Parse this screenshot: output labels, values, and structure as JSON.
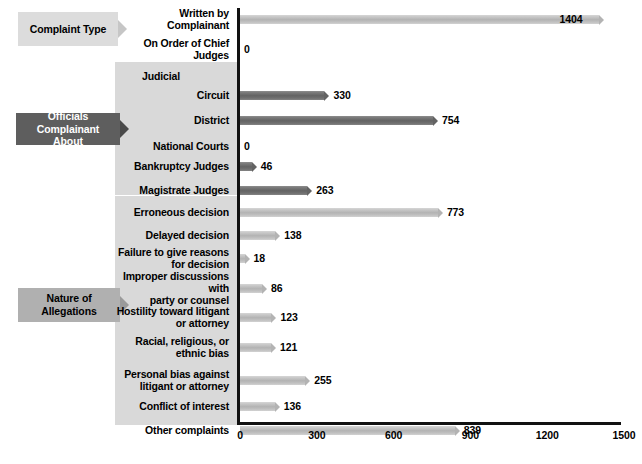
{
  "chart_data": {
    "type": "bar",
    "orientation": "horizontal",
    "title": "",
    "xlabel": "",
    "ylabel": "",
    "xlim": [
      0,
      1500
    ],
    "xticks": [
      "0",
      "300",
      "600",
      "900",
      "1200",
      "1500"
    ],
    "grid": false,
    "legend": null,
    "groups": [
      {
        "label": "Complaint Type",
        "style": "light",
        "categories": [
          {
            "label": "Written by Complainant",
            "value": 1404,
            "shade": "light",
            "label_inside": true
          },
          {
            "label": "On Order of Chief Judges",
            "value": 0,
            "shade": "light"
          }
        ]
      },
      {
        "label": "Officials Complainant About",
        "label_lines": [
          "Officials Complainant",
          "About"
        ],
        "style": "dark",
        "categories": [
          {
            "label": "Judicial",
            "value": null,
            "subheader": true
          },
          {
            "label": "Circuit",
            "value": 330,
            "shade": "dark"
          },
          {
            "label": "District",
            "value": 754,
            "shade": "dark"
          },
          {
            "label": "National Courts",
            "value": 0,
            "shade": "dark"
          },
          {
            "label": "Bankruptcy Judges",
            "value": 46,
            "shade": "dark"
          },
          {
            "label": "Magistrate Judges",
            "value": 263,
            "shade": "dark"
          }
        ]
      },
      {
        "label": "Nature of Allegations",
        "label_lines": [
          "Nature of",
          "Allegations"
        ],
        "style": "medium",
        "categories": [
          {
            "label": "Erroneous decision",
            "value": 773,
            "shade": "light"
          },
          {
            "label": "Delayed decision",
            "value": 138,
            "shade": "light"
          },
          {
            "label": "Failure to give reasons for decision",
            "label_lines": [
              "Failure to give reasons",
              "for decision"
            ],
            "value": 18,
            "shade": "light"
          },
          {
            "label": "Improper discussions with party or counsel",
            "label_lines": [
              "Improper discussions with",
              "party or counsel"
            ],
            "value": 86,
            "shade": "light"
          },
          {
            "label": "Hostility toward litigant or attorney",
            "label_lines": [
              "Hostility toward litigant",
              "or attorney"
            ],
            "value": 123,
            "shade": "light"
          },
          {
            "label": "Racial, religious, or ethnic bias",
            "label_lines": [
              "Racial, religious, or",
              "ethnic bias"
            ],
            "value": 121,
            "shade": "light"
          },
          {
            "label": "Personal bias against litigant or attorney",
            "label_lines": [
              "Personal bias against",
              "litigant or attorney"
            ],
            "value": 255,
            "shade": "light"
          },
          {
            "label": "Conflict of interest",
            "value": 136,
            "shade": "light"
          },
          {
            "label": "Other complaints",
            "value": 839,
            "shade": "light"
          }
        ]
      }
    ]
  },
  "groups": {
    "g0": {
      "label": "Complaint Type"
    },
    "g1": {
      "line1": "Officials Complainant",
      "line2": "About"
    },
    "g2": {
      "line1": "Nature of",
      "line2": "Allegations"
    }
  },
  "colors": {
    "bar_light": "#b3b3b3",
    "bar_dark": "#636363",
    "axis": "#111111",
    "band_gray": "#d9d9d9",
    "group_light": "#dcdcdc",
    "group_dark": "#5e5e5e",
    "group_medium": "#b0b0b0",
    "text": "#000000"
  }
}
